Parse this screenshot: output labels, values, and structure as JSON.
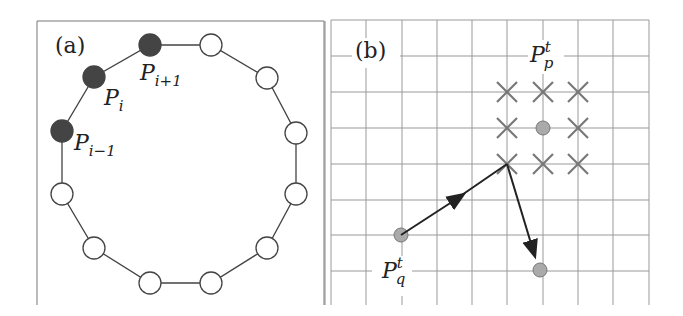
{
  "panel_a": {
    "label": "(a)",
    "nodes": [
      {
        "x": 150,
        "y": 45,
        "filled": true
      },
      {
        "x": 211,
        "y": 45,
        "filled": false
      },
      {
        "x": 267,
        "y": 78,
        "filled": false
      },
      {
        "x": 296,
        "y": 133,
        "filled": false
      },
      {
        "x": 296,
        "y": 194,
        "filled": false
      },
      {
        "x": 267,
        "y": 248,
        "filled": false
      },
      {
        "x": 211,
        "y": 283,
        "filled": false
      },
      {
        "x": 150,
        "y": 283,
        "filled": false
      },
      {
        "x": 94,
        "y": 248,
        "filled": false
      },
      {
        "x": 62,
        "y": 194,
        "filled": false
      },
      {
        "x": 62,
        "y": 131,
        "filled": true
      },
      {
        "x": 94,
        "y": 77,
        "filled": true
      }
    ],
    "point_labels": {
      "p_i_plus_1": {
        "base": "P",
        "sub": "i+1"
      },
      "p_i": {
        "base": "P",
        "sub": "i"
      },
      "p_i_minus_1": {
        "base": "P",
        "sub": "i−1"
      }
    }
  },
  "panel_b": {
    "label": "(b)",
    "p_p": {
      "base": "P",
      "sub": "p",
      "sup": "t"
    },
    "p_q": {
      "base": "P",
      "sub": "q",
      "sup": "t"
    },
    "colors": {
      "point": "#aaaaaa",
      "cross": "#777777",
      "grid": "#999999",
      "arrow": "#222222"
    }
  }
}
